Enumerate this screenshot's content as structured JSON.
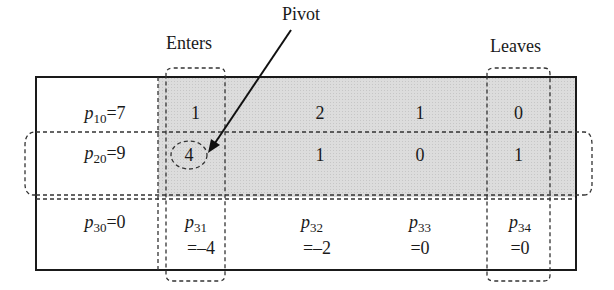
{
  "annotations": {
    "enters": "Enters",
    "leaves": "Leaves",
    "pivot": "Pivot"
  },
  "colors": {
    "shade": "#d6d6d6",
    "border": "#1a1a1a",
    "dash": "#333333"
  },
  "rows": [
    {
      "lhs": {
        "var": "p",
        "sub": "10",
        "eq": "=",
        "val": "7"
      },
      "cells": [
        "1",
        "2",
        "1",
        "0"
      ]
    },
    {
      "lhs": {
        "var": "p",
        "sub": "20",
        "eq": "=",
        "val": "9"
      },
      "cells": [
        "4",
        "1",
        "0",
        "1"
      ]
    },
    {
      "lhs": {
        "var": "p",
        "sub": "30",
        "eq": "=",
        "val": "0"
      },
      "cells": [
        {
          "var": "p",
          "sub": "31",
          "val": "=–4"
        },
        {
          "var": "p",
          "sub": "32",
          "val": "=–2"
        },
        {
          "var": "p",
          "sub": "33",
          "val": "=0"
        },
        {
          "var": "p",
          "sub": "34",
          "val": "=0"
        }
      ]
    }
  ],
  "pivot_cell": {
    "row": 2,
    "col": 1,
    "value": "4"
  },
  "entering_column": 1,
  "leaving_column": 4,
  "pivot_row": 2
}
